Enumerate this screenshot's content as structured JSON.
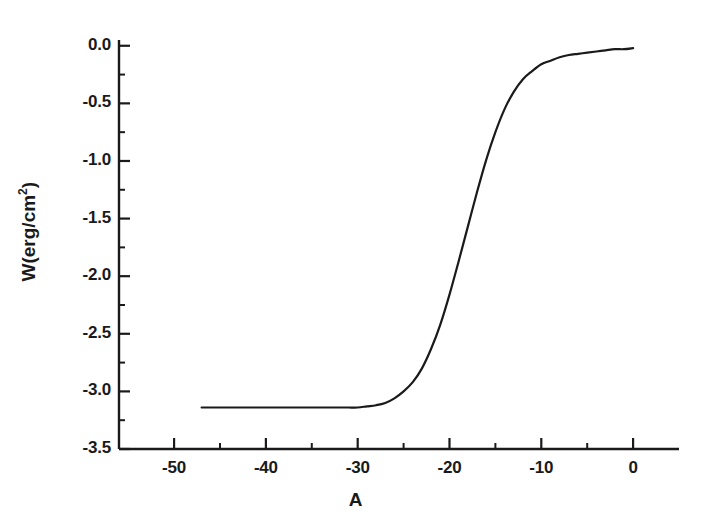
{
  "chart_data": {
    "type": "line",
    "title": "",
    "subtitle": "",
    "xlabel": "A",
    "ylabel": "W(erg/cm2)",
    "ylabel_base": "W(erg/cm",
    "ylabel_exponent": "2",
    "ylabel_close": ")",
    "xlim": [
      -56,
      5
    ],
    "ylim": [
      -3.5,
      0.05
    ],
    "grid": false,
    "legend": null,
    "x_major_ticks": [
      -50,
      -40,
      -30,
      -20,
      -10,
      0
    ],
    "x_major_tick_labels": [
      "-50",
      "-40",
      "-30",
      "-20",
      "-10",
      "0"
    ],
    "x_minor_ticks": [
      -45,
      -35,
      -25,
      -15,
      -5
    ],
    "y_major_ticks": [
      0.0,
      -0.5,
      -1.0,
      -1.5,
      -2.0,
      -2.5,
      -3.0,
      -3.5
    ],
    "y_major_tick_labels": [
      "0.0",
      "-0.5",
      "-1.0",
      "-1.5",
      "-2.0",
      "-2.5",
      "-3.0",
      "-3.5"
    ],
    "y_minor_ticks": [
      -0.25,
      -0.75,
      -1.25,
      -1.75,
      -2.25,
      -2.75,
      -3.25
    ],
    "line_color": "#1a1a1a",
    "line_width": 2.2,
    "axis_color": "#1a1a1a",
    "background_color": "#ffffff",
    "series": [
      {
        "name": "W(A)",
        "x": [
          -47.0,
          -45.0,
          -43.0,
          -41.0,
          -39.0,
          -37.0,
          -35.0,
          -33.0,
          -32.0,
          -31.0,
          -30.0,
          -29.0,
          -28.0,
          -27.0,
          -26.0,
          -25.0,
          -24.0,
          -23.0,
          -22.0,
          -21.0,
          -20.0,
          -19.0,
          -18.0,
          -17.0,
          -16.0,
          -15.0,
          -14.0,
          -13.0,
          -12.0,
          -11.0,
          -10.0,
          -9.0,
          -8.0,
          -7.0,
          -6.0,
          -5.0,
          -4.0,
          -3.0,
          -2.0,
          -1.0,
          0.0
        ],
        "y": [
          -3.14,
          -3.14,
          -3.14,
          -3.14,
          -3.14,
          -3.14,
          -3.14,
          -3.14,
          -3.14,
          -3.14,
          -3.14,
          -3.13,
          -3.12,
          -3.1,
          -3.06,
          -3.0,
          -2.92,
          -2.8,
          -2.63,
          -2.42,
          -2.16,
          -1.87,
          -1.57,
          -1.27,
          -0.99,
          -0.75,
          -0.55,
          -0.4,
          -0.29,
          -0.22,
          -0.16,
          -0.13,
          -0.1,
          -0.08,
          -0.07,
          -0.06,
          -0.05,
          -0.04,
          -0.03,
          -0.03,
          -0.02
        ]
      }
    ],
    "curve_description": "Monotonically increasing sigmoid; left plateau at W = -3.14 erg/cm2 for A below -30, inflection near A = -18, approaching W = -0.02 erg/cm2 at A = 0"
  },
  "axes": {
    "x_axis_name": "A",
    "y_axis_name": "W(erg/cm2)"
  }
}
